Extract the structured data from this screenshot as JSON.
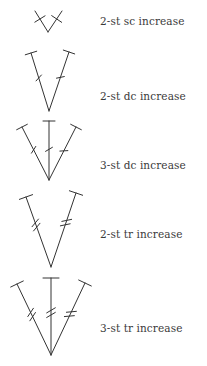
{
  "items": [
    {
      "label": "2-st sc increase",
      "stitch": "sc",
      "count": 2
    },
    {
      "label": "2-st dc increase",
      "stitch": "dc",
      "count": 2
    },
    {
      "label": "3-st dc increase",
      "stitch": "dc",
      "count": 3
    },
    {
      "label": "2-st tr increase",
      "stitch": "tr",
      "count": 2
    },
    {
      "label": "3-st tr increase",
      "stitch": "tr",
      "count": 3
    }
  ],
  "colors": {
    "stroke": "#333333",
    "text": "#3a3a3a",
    "background": "#ffffff"
  }
}
